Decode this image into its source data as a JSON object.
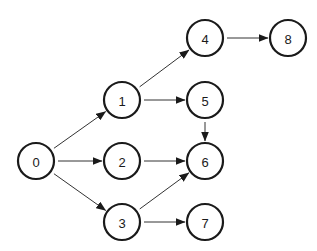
{
  "diagram": {
    "type": "directed-graph",
    "colors": {
      "stroke": "#1a1a1a",
      "edge": "#333333",
      "background": "#ffffff"
    },
    "node_radius": 18,
    "nodes": [
      {
        "id": "0",
        "label": "0",
        "x": 36,
        "y": 161
      },
      {
        "id": "1",
        "label": "1",
        "x": 122,
        "y": 100
      },
      {
        "id": "2",
        "label": "2",
        "x": 122,
        "y": 161
      },
      {
        "id": "3",
        "label": "3",
        "x": 122,
        "y": 222
      },
      {
        "id": "4",
        "label": "4",
        "x": 205,
        "y": 38
      },
      {
        "id": "5",
        "label": "5",
        "x": 205,
        "y": 100
      },
      {
        "id": "6",
        "label": "6",
        "x": 205,
        "y": 161
      },
      {
        "id": "7",
        "label": "7",
        "x": 205,
        "y": 222
      },
      {
        "id": "8",
        "label": "8",
        "x": 288,
        "y": 38
      }
    ],
    "edges": [
      {
        "from": "0",
        "to": "1"
      },
      {
        "from": "0",
        "to": "2"
      },
      {
        "from": "0",
        "to": "3"
      },
      {
        "from": "1",
        "to": "4"
      },
      {
        "from": "1",
        "to": "5"
      },
      {
        "from": "2",
        "to": "6"
      },
      {
        "from": "3",
        "to": "6"
      },
      {
        "from": "3",
        "to": "7"
      },
      {
        "from": "4",
        "to": "8"
      },
      {
        "from": "5",
        "to": "6"
      }
    ]
  }
}
